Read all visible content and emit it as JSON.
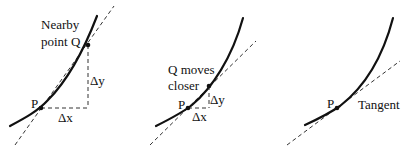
{
  "panels": [
    {
      "id": "secant-far",
      "labels": {
        "q_line1": "Nearby",
        "q_line2": "point Q",
        "p": "P",
        "dy": "Δy",
        "dx": "Δx"
      }
    },
    {
      "id": "secant-near",
      "labels": {
        "q_line1": "Q moves",
        "q_line2": "closer",
        "p": "P",
        "dy": "Δy",
        "dx": "Δx"
      }
    },
    {
      "id": "tangent",
      "labels": {
        "p": "P",
        "tangent": "Tangent"
      }
    }
  ],
  "colors": {
    "ink": "#111111",
    "background": "#ffffff"
  }
}
